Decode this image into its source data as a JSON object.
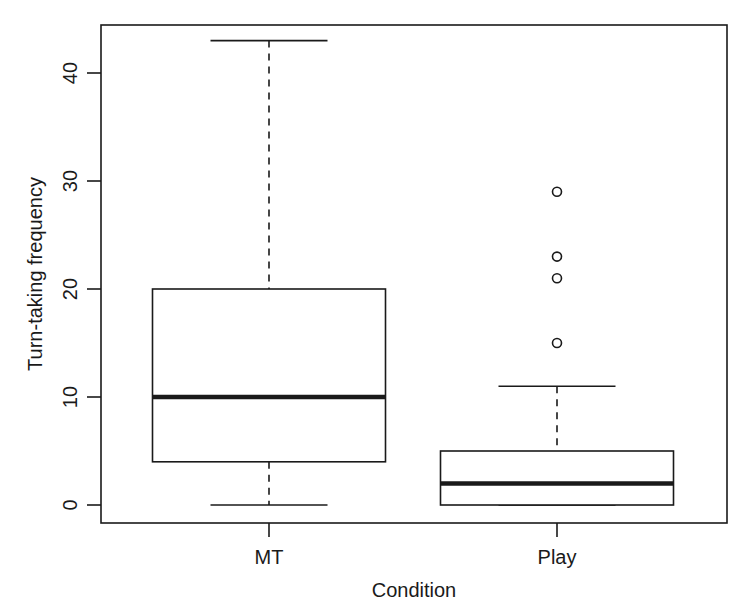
{
  "chart_data": {
    "type": "boxplot",
    "title": "",
    "xlabel": "Condition",
    "ylabel": "Turn-taking frequency",
    "categories": [
      "MT",
      "Play"
    ],
    "yticks": [
      0,
      10,
      20,
      30,
      40
    ],
    "ylim": [
      -1.7,
      44.8
    ],
    "grid": false,
    "legend": null,
    "series": [
      {
        "name": "MT",
        "whisker_low": 0,
        "q1": 4,
        "median": 10,
        "q3": 20,
        "whisker_high": 43,
        "outliers": []
      },
      {
        "name": "Play",
        "whisker_low": 0,
        "q1": 0,
        "median": 2,
        "q3": 5,
        "whisker_high": 11,
        "outliers": [
          15,
          21,
          23,
          29
        ]
      }
    ]
  },
  "labels": {
    "xlabel": "Condition",
    "ylabel": "Turn-taking frequency",
    "categories": [
      "MT",
      "Play"
    ],
    "yticks": [
      "0",
      "10",
      "20",
      "30",
      "40"
    ]
  },
  "colors": {
    "stroke": "#1a1a1a",
    "background": "#ffffff"
  }
}
